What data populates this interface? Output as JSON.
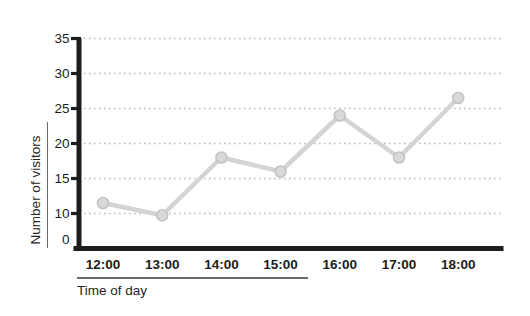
{
  "chart_data": {
    "type": "line",
    "title": "",
    "xlabel": "Time of day",
    "ylabel": "Number of visitors",
    "categories": [
      "12:00",
      "13:00",
      "14:00",
      "15:00",
      "16:00",
      "17:00",
      "18:00"
    ],
    "series": [
      {
        "name": "Number of visitors",
        "values": [
          11.5,
          9.5,
          18,
          16,
          24,
          18,
          26.5
        ]
      }
    ],
    "y_ticks": [
      0,
      10,
      15,
      20,
      25,
      30,
      35
    ],
    "y_axis_note": "y ticks are evenly spaced despite irregular value intervals (0 to 10 step equals 5-unit steps)",
    "grid": "dotted horizontal gridlines at every y tick except 0",
    "legend": "none",
    "colors": {
      "background": "#ffffff",
      "line": "#d4d4d4",
      "marker_fill": "#d9d9d9",
      "marker_stroke": "#c3c3c3",
      "axis": "#1d1d1d",
      "gridline": "#bcbcbc",
      "tick_label": "#1c1c1c",
      "axis_label": "#262626",
      "rule": "#6a6a6a"
    }
  }
}
